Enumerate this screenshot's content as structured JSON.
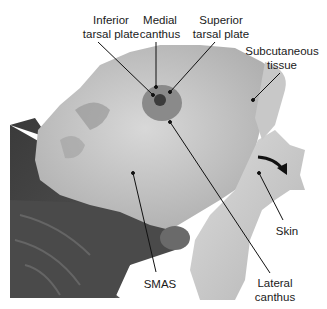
{
  "figure": {
    "labels": [
      {
        "id": "inferior-tarsal-plate",
        "lines": [
          "Inferior",
          "tarsal plate"
        ]
      },
      {
        "id": "medial-canthus",
        "lines": [
          "Medial",
          "canthus"
        ]
      },
      {
        "id": "superior-tarsal-plate",
        "lines": [
          "Superior",
          "tarsal plate"
        ]
      },
      {
        "id": "subcutaneous-tissue",
        "lines": [
          "Subcutaneous",
          "tissue"
        ]
      },
      {
        "id": "skin",
        "lines": [
          "Skin"
        ]
      },
      {
        "id": "smas",
        "lines": [
          "SMAS"
        ]
      },
      {
        "id": "lateral-canthus",
        "lines": [
          "Lateral",
          "canthus"
        ]
      }
    ],
    "colors": {
      "background": "#ffffff",
      "label_text": "#1a1a1a",
      "leader_line": "#111111"
    },
    "icons": [
      "curved-arrow-icon"
    ]
  }
}
